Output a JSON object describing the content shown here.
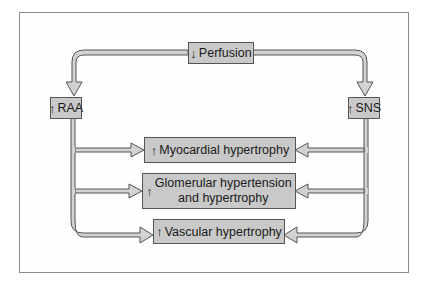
{
  "diagram": {
    "nodes": {
      "perfusion": {
        "arrow": "↓",
        "label": "Perfusion"
      },
      "raa": {
        "arrow": "↑",
        "label": "RAA"
      },
      "sns": {
        "arrow": "↑",
        "label": "SNS"
      },
      "myocardial": {
        "arrow": "↑",
        "label": "Myocardial hypertrophy"
      },
      "glomerular": {
        "arrow": "↑",
        "line1": "Glomerular hypertension",
        "line2": "and hypertrophy"
      },
      "vascular": {
        "arrow": "↑",
        "label": "Vascular hypertrophy"
      }
    },
    "edges": [
      {
        "from": "Perfusion",
        "to": "RAA"
      },
      {
        "from": "Perfusion",
        "to": "SNS"
      },
      {
        "from": "RAA",
        "to": "Myocardial hypertrophy"
      },
      {
        "from": "RAA",
        "to": "Glomerular hypertension and hypertrophy"
      },
      {
        "from": "RAA",
        "to": "Vascular hypertrophy"
      },
      {
        "from": "SNS",
        "to": "Myocardial hypertrophy"
      },
      {
        "from": "SNS",
        "to": "Glomerular hypertension and hypertrophy"
      },
      {
        "from": "SNS",
        "to": "Vascular hypertrophy"
      }
    ],
    "colors": {
      "box_fill": "#c9c9c9",
      "arrow_fill": "#d0d0d0",
      "outline": "#555555"
    }
  }
}
